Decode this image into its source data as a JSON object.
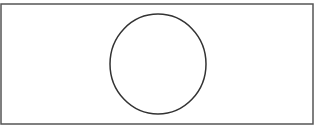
{
  "diagram": {
    "shapes": [
      {
        "type": "rectangle",
        "x": 1,
        "y": 4,
        "width": 312,
        "height": 120,
        "stroke": "#555555"
      },
      {
        "type": "circle",
        "cx": 158,
        "cy": 64,
        "r": 48,
        "stroke": "#333333"
      }
    ],
    "colors": {
      "background": "#ffffff",
      "frame_stroke": "#555555",
      "circle_stroke": "#333333"
    }
  }
}
